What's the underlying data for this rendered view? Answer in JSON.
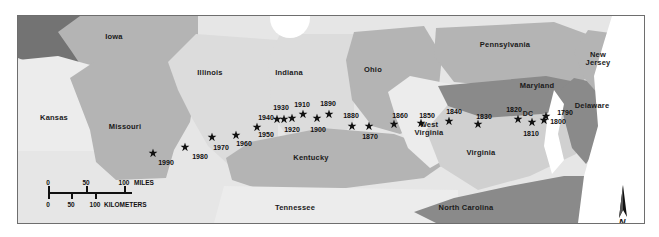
{
  "figure": {
    "kind": "thematic-map",
    "frame": {
      "x": 17,
      "y": 15,
      "w": 626,
      "h": 207
    }
  },
  "palette": {
    "background": "#ffffff",
    "frame_line": "#6e6e6e",
    "very_light": "#f0f0f0",
    "light": "#e2e2e2",
    "mid_light": "#d2d2d2",
    "mid": "#b4b4b4",
    "mid_dark": "#9b9b9b",
    "dark": "#8a8a8a",
    "darker": "#737373",
    "water": "#ffffff",
    "label_text": "#1a1a1a",
    "marker": "#111111"
  },
  "state_labels": [
    {
      "name": "Iowa",
      "text": "Iowa",
      "x": 113,
      "y": 36,
      "fill": "#b4b4b4"
    },
    {
      "name": "Kansas",
      "text": "Kansas",
      "x": 53,
      "y": 117,
      "fill": "#e8e8e8"
    },
    {
      "name": "Missouri",
      "text": "Missouri",
      "x": 124,
      "y": 126,
      "fill": "#b4b4b4"
    },
    {
      "name": "Illinois",
      "text": "Illinois",
      "x": 209,
      "y": 72,
      "fill": "#d8d8d8"
    },
    {
      "name": "Indiana",
      "text": "Indiana",
      "x": 288,
      "y": 72,
      "fill": "#d8d8d8"
    },
    {
      "name": "Ohio",
      "text": "Ohio",
      "x": 372,
      "y": 69,
      "fill": "#b4b4b4"
    },
    {
      "name": "Kentucky",
      "text": "Kentucky",
      "x": 310,
      "y": 157,
      "fill": "#b4b4b4"
    },
    {
      "name": "Tennessee",
      "text": "Tennessee",
      "x": 294,
      "y": 207,
      "fill": "#e8e8e8"
    },
    {
      "name": "North Carolina",
      "text": "North Carolina",
      "x": 465,
      "y": 207,
      "fill": "#8a8a8a"
    },
    {
      "name": "West Virginia",
      "text": "West\nVirginia",
      "x": 428,
      "y": 128,
      "fill": "#e8e8e8"
    },
    {
      "name": "Virginia",
      "text": "Virginia",
      "x": 480,
      "y": 152,
      "fill": "#d0d0d0"
    },
    {
      "name": "Pennsylvania",
      "text": "Pennsylvania",
      "x": 504,
      "y": 44,
      "fill": "#b4b4b4"
    },
    {
      "name": "Maryland",
      "text": "Maryland",
      "x": 536,
      "y": 85,
      "fill": "#8a8a8a"
    },
    {
      "name": "Delaware",
      "text": "Delaware",
      "x": 591,
      "y": 105,
      "fill": "#8a8a8a"
    },
    {
      "name": "New Jersey",
      "text": "New\nJersey",
      "x": 597,
      "y": 58,
      "fill": "#b4b4b4"
    },
    {
      "name": "DC",
      "text": "DC",
      "x": 527,
      "y": 113,
      "fill": "#8a8a8a"
    }
  ],
  "markers": [
    {
      "year": "1790",
      "star_x": 528,
      "star_y": 100,
      "label_x": 547,
      "label_y": 96
    },
    {
      "year": "1800",
      "star_x": 526,
      "star_y": 104,
      "label_x": 540,
      "label_y": 105
    },
    {
      "year": "1810",
      "star_x": 514,
      "star_y": 106,
      "label_x": 513,
      "label_y": 117
    },
    {
      "year": "1820",
      "star_x": 500,
      "star_y": 103,
      "label_x": 496,
      "label_y": 93
    },
    {
      "year": "1830",
      "star_x": 460,
      "star_y": 108,
      "label_x": 466,
      "label_y": 100
    },
    {
      "year": "1840",
      "star_x": 431,
      "star_y": 105,
      "label_x": 436,
      "label_y": 95
    },
    {
      "year": "1850",
      "star_x": 403,
      "star_y": 107,
      "label_x": 409,
      "label_y": 99
    },
    {
      "year": "1860",
      "star_x": 376,
      "star_y": 108,
      "label_x": 382,
      "label_y": 99
    },
    {
      "year": "1870",
      "star_x": 351,
      "star_y": 110,
      "label_x": 352,
      "label_y": 120
    },
    {
      "year": "1880",
      "star_x": 334,
      "star_y": 110,
      "label_x": 333,
      "label_y": 99
    },
    {
      "year": "1890",
      "star_x": 311,
      "star_y": 98,
      "label_x": 310,
      "label_y": 87
    },
    {
      "year": "1900",
      "star_x": 299,
      "star_y": 102,
      "label_x": 300,
      "label_y": 113
    },
    {
      "year": "1910",
      "star_x": 285,
      "star_y": 98,
      "label_x": 284,
      "label_y": 88
    },
    {
      "year": "1920",
      "star_x": 274,
      "star_y": 102,
      "label_x": 274,
      "label_y": 113
    },
    {
      "year": "1930",
      "star_x": 266,
      "star_y": 103,
      "label_x": 263,
      "label_y": 91
    },
    {
      "year": "1940",
      "star_x": 259,
      "star_y": 103,
      "label_x": 248,
      "label_y": 101
    },
    {
      "year": "1950",
      "star_x": 239,
      "star_y": 111,
      "label_x": 248,
      "label_y": 118
    },
    {
      "year": "1960",
      "star_x": 218,
      "star_y": 119,
      "label_x": 226,
      "label_y": 127
    },
    {
      "year": "1970",
      "star_x": 194,
      "star_y": 121,
      "label_x": 203,
      "label_y": 131
    },
    {
      "year": "1980",
      "star_x": 167,
      "star_y": 131,
      "label_x": 182,
      "label_y": 140
    },
    {
      "year": "1990",
      "star_x": 135,
      "star_y": 137,
      "label_x": 148,
      "label_y": 146
    }
  ],
  "scale_bar": {
    "miles_label": "MILES",
    "kilometers_label": "KILOMETERS",
    "miles_ticks": [
      "0",
      "50",
      "100"
    ],
    "kilometers_ticks": [
      "0",
      "50",
      "100"
    ]
  },
  "north_arrow": {
    "label": "N"
  }
}
